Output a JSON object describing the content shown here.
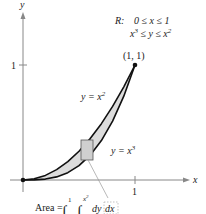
{
  "figure": {
    "axes": {
      "x_label": "x",
      "y_label": "y",
      "x_tick": "1",
      "y_tick": "1"
    },
    "region": {
      "name": "R:",
      "cond1": "0 ≤ x ≤ 1",
      "cond2_lhs": "x",
      "cond2_exp": "3",
      "cond2_mid": " ≤ y ≤ x",
      "cond2_exp2": "2"
    },
    "point_label": "(1, 1)",
    "curve_upper": {
      "lhs": "y = x",
      "exp": "2"
    },
    "curve_lower": {
      "lhs": "y = x",
      "exp": "3"
    },
    "area_formula": {
      "lhs": "Area =",
      "outer_upper": "1",
      "inner_upper_base": "x",
      "inner_upper_exp": "2",
      "dy": "dy",
      "dx": "dx"
    },
    "colors": {
      "curve": "#111111",
      "fill": "#d9d9d9",
      "axis": "#777777",
      "rect_fill": "#cfcfcf",
      "rect_stroke": "#555555"
    }
  }
}
